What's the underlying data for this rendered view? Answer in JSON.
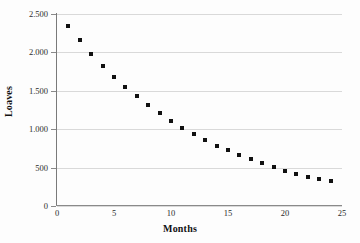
{
  "chart_data": {
    "type": "scatter",
    "title": "",
    "xlabel": "Months",
    "ylabel": "Loaves",
    "xlim": [
      0,
      25
    ],
    "ylim": [
      0,
      2500
    ],
    "grid": true,
    "legend": false,
    "marker_color": "#111111",
    "gridline_color": "#d9d9d9",
    "axis_color": "#8a8a8a",
    "x_ticks": [
      "0",
      "5",
      "10",
      "15",
      "20",
      "25"
    ],
    "x_tick_values": [
      0,
      5,
      10,
      15,
      20,
      25
    ],
    "y_ticks": [
      "0",
      "500",
      "1.000",
      "1.500",
      "2.000",
      "2.500"
    ],
    "y_tick_values": [
      0,
      500,
      1000,
      1500,
      2000,
      2500
    ],
    "x": [
      1,
      2,
      3,
      4,
      5,
      6,
      7,
      8,
      9,
      10,
      11,
      12,
      13,
      14,
      15,
      16,
      17,
      18,
      19,
      20,
      21,
      22,
      23,
      24
    ],
    "values": [
      2350,
      2155,
      1975,
      1820,
      1680,
      1555,
      1435,
      1315,
      1215,
      1110,
      1020,
      940,
      860,
      785,
      735,
      665,
      615,
      560,
      510,
      460,
      420,
      380,
      350,
      330
    ]
  }
}
